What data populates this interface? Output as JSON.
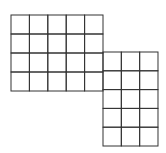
{
  "figure": {
    "stroke_color": "#333333",
    "background": "#ffffff",
    "blocks": [
      {
        "name": "left-block",
        "x": 11,
        "y": 15,
        "cols": 5,
        "rows": 4,
        "cell_w": 18.4,
        "cell_h": 19
      },
      {
        "name": "right-block",
        "x": 103,
        "y": 52,
        "cols": 3,
        "rows": 5,
        "cell_w": 18.33,
        "cell_h": 18.8
      }
    ]
  }
}
